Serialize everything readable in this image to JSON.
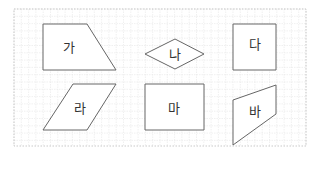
{
  "diagram": {
    "grid": {
      "x0": 14,
      "y0": 9,
      "x1": 306,
      "y1": 146,
      "step": 7.3,
      "line_color": "#e6e6e6",
      "border_color": "#bbbbbb"
    },
    "shape_stroke": "#666666",
    "shapes": [
      {
        "id": "ga",
        "label": "가",
        "type": "trapezoid",
        "points": "43,24 87,24 116,70 43,70",
        "label_x": 69,
        "label_y": 47
      },
      {
        "id": "na",
        "label": "나",
        "type": "rhombus",
        "points": "145,54 175,39 204,54 175,69",
        "label_x": 175,
        "label_y": 54
      },
      {
        "id": "da",
        "label": "다",
        "type": "square",
        "points": "233,24 276,24 276,70 233,70",
        "label_x": 255,
        "label_y": 44
      },
      {
        "id": "ra",
        "label": "라",
        "type": "parallelogram",
        "points": "73,84 116,84 87,130 43,130",
        "label_x": 80,
        "label_y": 108
      },
      {
        "id": "ma",
        "label": "마",
        "type": "rectangle",
        "points": "145,84 204,84 204,130 145,130",
        "label_x": 174,
        "label_y": 108
      },
      {
        "id": "ba",
        "label": "바",
        "type": "quadrilateral",
        "points": "233,100 276,85 276,114 233,145",
        "label_x": 255,
        "label_y": 111
      }
    ]
  }
}
